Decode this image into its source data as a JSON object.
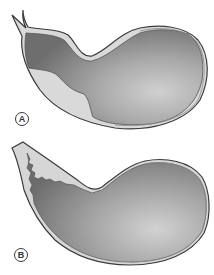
{
  "figure": {
    "panels": [
      {
        "id": "A",
        "label": "A",
        "description": "Stomach outline with darker mucosal region extending to the oesophagus; smooth boundary between pale and dark areas"
      },
      {
        "id": "B",
        "label": "B",
        "description": "Stomach outline with irregular, jagged boundary between pale oesophageal region and darker gastric mucosa"
      }
    ]
  },
  "colors": {
    "outline": "#3a3a3a",
    "pale_region": "#d2d2d2",
    "dark_region": "#7a7a7a",
    "mid_region": "#a8a8a8",
    "light_region": "#c8c8c8",
    "background": "#ffffff"
  }
}
